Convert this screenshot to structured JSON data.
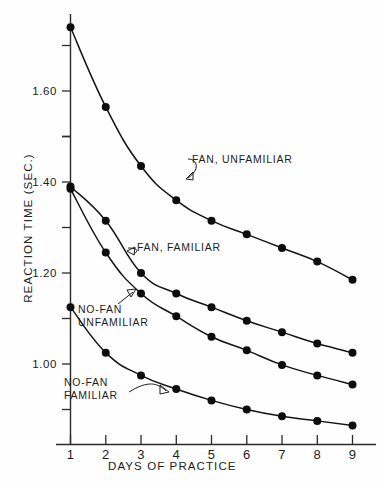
{
  "chart_data": {
    "type": "line",
    "title": "",
    "xlabel": "DAYS  OF  PRACTICE",
    "ylabel": "REACTION  TIME  (SEC.)",
    "x": [
      1,
      2,
      3,
      4,
      5,
      6,
      7,
      8,
      9
    ],
    "xlim": [
      0.6,
      9.4
    ],
    "ylim": [
      0.845,
      1.78
    ],
    "grid": false,
    "legend_position": "inline-annotations",
    "xticklabels": [
      "1",
      "2",
      "3",
      "4",
      "5",
      "6",
      "7",
      "8",
      "9"
    ],
    "yticklabels": [
      "1.60",
      "1.40",
      "1.20",
      "1.00"
    ],
    "ytickvalues": [
      1.6,
      1.4,
      1.2,
      1.0
    ],
    "yminorticks": [
      1.7,
      1.5,
      1.3,
      1.1,
      0.9
    ],
    "series": [
      {
        "name": "FAN, UNFAMILIAR",
        "values": [
          1.74,
          1.565,
          1.435,
          1.36,
          1.315,
          1.285,
          1.255,
          1.225,
          1.185
        ]
      },
      {
        "name": "FAN, FAMILIAR",
        "values": [
          1.39,
          1.315,
          1.2,
          1.155,
          1.125,
          1.095,
          1.07,
          1.045,
          1.025
        ]
      },
      {
        "name": "NO-FAN UNFAMILIAR",
        "values": [
          1.385,
          1.245,
          1.155,
          1.105,
          1.06,
          1.03,
          0.998,
          0.975,
          0.955
        ]
      },
      {
        "name": "NO-FAN FAMILIAR",
        "values": [
          1.125,
          1.025,
          0.975,
          0.945,
          0.92,
          0.9,
          0.885,
          0.875,
          0.865
        ]
      }
    ],
    "annotations": [
      {
        "id": "ann-fan-unfamiliar",
        "line1": "FAN, UNFAMILIAR",
        "line2": ""
      },
      {
        "id": "ann-fan-familiar",
        "line1": "FAN, FAMILIAR",
        "line2": ""
      },
      {
        "id": "ann-nofan-unfamiliar",
        "line1": "NO-FAN",
        "line2": "UNFAMILIAR"
      },
      {
        "id": "ann-nofan-familiar",
        "line1": "NO-FAN",
        "line2": "FAMILIAR"
      }
    ],
    "colors": {
      "curve": "#141414",
      "point": "#0d0d0d",
      "axis": "#2a2a2a",
      "text": "#1d1d1d",
      "background": "#fefefe"
    }
  }
}
